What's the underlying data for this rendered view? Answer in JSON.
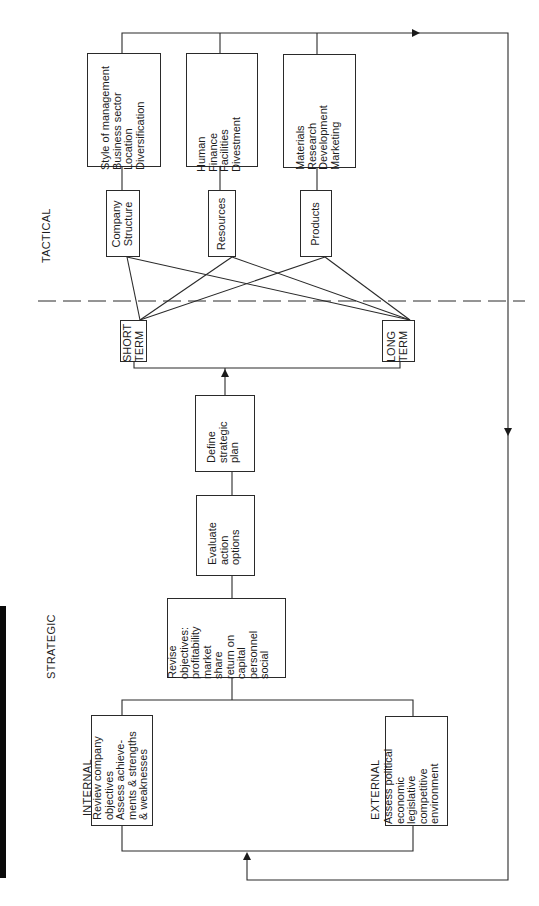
{
  "sections": {
    "tactical": "TACTICAL",
    "strategic": "STRATEGIC",
    "internal": "INTERNAL",
    "external": "EXTERNAL"
  },
  "tactical": {
    "detail_boxes": [
      {
        "text": "Style of management\nBusiness sector\nLocation\nDiversification"
      },
      {
        "text": "Human\nFinance\nFacilities\nDivestment"
      },
      {
        "text": "Materials\nResearch\nDevelopment\nMarketing"
      }
    ],
    "category_boxes": [
      {
        "text": "Company\nStructure"
      },
      {
        "text": "Resources"
      },
      {
        "text": "Products"
      }
    ]
  },
  "terms": {
    "short": "SHORT\nTERM",
    "long": "LONG\nTERM"
  },
  "strategic": {
    "define": "Define\nstrategic\nplan",
    "evaluate": "Evaluate\naction\noptions",
    "revise": "Revise\nobjectives:\nprofitability\nmarket\nshare\nreturn on\ncapital\npersonnel\nsocial",
    "internal_box": "Review company\nobjectives\nAssess achieve-\nments & strengths\n& weaknesses",
    "external_box": "Assess political\neconomic\nlegislative\ncompetitive\nenvironment"
  },
  "colors": {
    "line": "#2a2a2a",
    "bar": "#0a0a0a",
    "background": "#ffffff"
  }
}
